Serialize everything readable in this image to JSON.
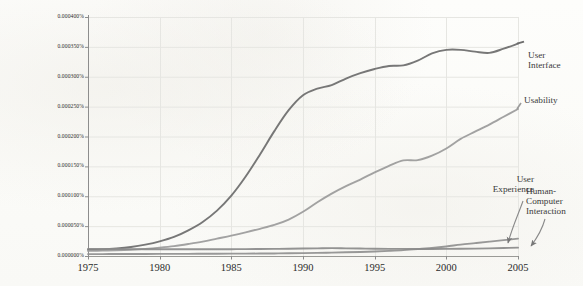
{
  "chart_data": {
    "type": "line",
    "title": "",
    "subtitle": "",
    "xlabel": "",
    "ylabel": "",
    "xlim": [
      1975,
      2005
    ],
    "ylim": [
      0.0,
      0.0004
    ],
    "grid": true,
    "legend_position": "inline-right-annotations",
    "y_tick_labels": [
      "0.000400%",
      "0.000350%",
      "0.000300%",
      "0.000250%",
      "0.000200%",
      "0.000150%",
      "0.000100%",
      "0.000050%",
      "0.000000%"
    ],
    "y_tick_values": [
      0.0004,
      0.00035,
      0.0003,
      0.00025,
      0.0002,
      0.00015,
      0.0001,
      5e-05,
      0.0
    ],
    "x_tick_labels": [
      "1975",
      "1980",
      "1985",
      "1990",
      "1995",
      "2000",
      "2005"
    ],
    "x_tick_values": [
      1975,
      1980,
      1985,
      1990,
      1995,
      2000,
      2005
    ],
    "x": [
      1975,
      1976,
      1977,
      1978,
      1979,
      1980,
      1981,
      1982,
      1983,
      1984,
      1985,
      1986,
      1987,
      1988,
      1989,
      1990,
      1991,
      1992,
      1993,
      1994,
      1995,
      1996,
      1997,
      1998,
      1999,
      2000,
      2001,
      2002,
      2003,
      2004,
      2005
    ],
    "series": [
      {
        "name": "User Interface",
        "color": "#6b6b6b",
        "label_text": "User\nInterface",
        "values": [
          1.05e-05,
          1.1e-05,
          1.25e-05,
          1.5e-05,
          1.9e-05,
          2.45e-05,
          3.2e-05,
          4.3e-05,
          5.7e-05,
          7.6e-05,
          0.000101,
          0.000133,
          0.00017,
          0.000209,
          0.000244,
          0.000269,
          0.00028,
          0.000286,
          0.000297,
          0.000306,
          0.000313,
          0.000318,
          0.000319,
          0.000327,
          0.000339,
          0.000345,
          0.000345,
          0.000342,
          0.00034,
          0.000347,
          0.0003555
        ]
      },
      {
        "name": "Usability",
        "color": "#9a9a9a",
        "label_text": "Usability",
        "values": [
          8.5e-06,
          9e-06,
          9.5e-06,
          1.05e-05,
          1.2e-05,
          1.4e-05,
          1.65e-05,
          2e-05,
          2.4e-05,
          2.9e-05,
          3.4e-05,
          3.95e-05,
          4.55e-05,
          5.2e-05,
          6.1e-05,
          7.4e-05,
          9e-05,
          0.0001045,
          0.000117,
          0.000128,
          0.00014,
          0.000151,
          0.00016,
          0.0001605,
          0.000168,
          0.00018,
          0.000196,
          0.000208,
          0.00022,
          0.000233,
          0.000246
        ]
      },
      {
        "name": "User Experience",
        "color": "#8f8f8f",
        "label_text": "User\nExperience",
        "values": [
          3.2e-06,
          3.2e-06,
          3.3e-06,
          3.3e-06,
          3.4e-06,
          3.5e-06,
          3.6e-06,
          3.6e-06,
          3.7e-06,
          3.8e-06,
          3.9e-06,
          4e-06,
          4.1e-06,
          4.3e-06,
          4.5e-06,
          4.8e-06,
          5.2e-06,
          5.7e-06,
          6.2e-06,
          6.8e-06,
          7.6e-06,
          8.6e-06,
          9.8e-06,
          1.15e-05,
          1.35e-05,
          1.6e-05,
          1.9e-05,
          2.15e-05,
          2.4e-05,
          2.65e-05,
          2.9e-05
        ]
      },
      {
        "name": "Human-Computer Interaction",
        "color": "#8a8a8a",
        "label_text": "Human-\nComputer\nInteraction",
        "values": [
          1.2e-05,
          1.18e-05,
          1.16e-05,
          1.15e-05,
          1.14e-05,
          1.13e-05,
          1.12e-05,
          1.12e-05,
          1.12e-05,
          1.13e-05,
          1.14e-05,
          1.15e-05,
          1.17e-05,
          1.19e-05,
          1.21e-05,
          1.25e-05,
          1.28e-05,
          1.31e-05,
          1.28e-05,
          1.25e-05,
          1.22e-05,
          1.2e-05,
          1.19e-05,
          1.18e-05,
          1.18e-05,
          1.19e-05,
          1.21e-05,
          1.24e-05,
          1.28e-05,
          1.33e-05,
          1.4e-05
        ]
      }
    ],
    "annotations": [
      {
        "text": "User\nInterface",
        "series": "User Interface",
        "style": "leader-line-right"
      },
      {
        "text": "Usability",
        "series": "Usability",
        "style": "leader-line-right"
      },
      {
        "text": "User\nExperience",
        "series": "User Experience",
        "style": "arrow-down-left"
      },
      {
        "text": "Human-\nComputer\nInteraction",
        "series": "Human-Computer Interaction",
        "style": "arrow-down-left"
      }
    ],
    "axis_color": "#8d8d8d",
    "grid_color": "#e6e6e2",
    "background_color": "#fdfdfb"
  }
}
